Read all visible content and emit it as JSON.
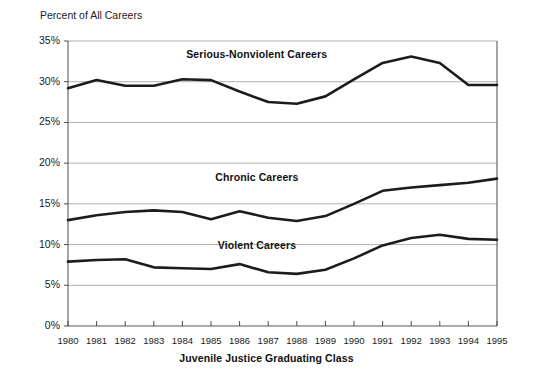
{
  "chart_data": {
    "type": "line",
    "title": "",
    "xlabel": "Juvenile Justice Graduating Class",
    "ylabel": "Percent of All Careers",
    "ylim": [
      0,
      35
    ],
    "xlim": [
      1980,
      1995
    ],
    "grid": true,
    "legend_position": "inline-annotations",
    "ytick_labels": [
      "35%",
      "30%",
      "25%",
      "20%",
      "15%",
      "10%",
      "5%",
      "0%"
    ],
    "ytick_values": [
      35,
      30,
      25,
      20,
      15,
      10,
      5,
      0
    ],
    "categories": [
      1980,
      1981,
      1982,
      1983,
      1984,
      1985,
      1986,
      1987,
      1988,
      1989,
      1990,
      1991,
      1992,
      1993,
      1994,
      1995
    ],
    "xtick_labels": [
      "1980",
      "1981",
      "1982",
      "1983",
      "1984",
      "1985",
      "1986",
      "1987",
      "1988",
      "1989",
      "1990",
      "1991",
      "1992",
      "1993",
      "1994",
      "1995"
    ],
    "series": [
      {
        "name": "Serious-Nonviolent Careers",
        "color": "#1c1c1c",
        "values": [
          29.2,
          30.2,
          29.5,
          29.5,
          30.3,
          30.2,
          28.8,
          27.5,
          27.3,
          28.2,
          30.3,
          32.3,
          33.1,
          32.3,
          29.6,
          29.6
        ]
      },
      {
        "name": "Chronic Careers",
        "color": "#1c1c1c",
        "values": [
          13.0,
          13.6,
          14.0,
          14.2,
          14.0,
          13.1,
          14.1,
          13.3,
          12.9,
          13.5,
          15.0,
          16.6,
          17.0,
          17.3,
          17.6,
          18.1
        ]
      },
      {
        "name": "Violent Careers",
        "color": "#1c1c1c",
        "values": [
          7.9,
          8.1,
          8.2,
          7.2,
          7.1,
          7.0,
          7.6,
          6.6,
          6.4,
          6.9,
          8.3,
          9.9,
          10.8,
          11.2,
          10.7,
          10.6
        ]
      }
    ],
    "annotations": [
      {
        "text": "Serious-Nonviolent Careers",
        "x": 1986.6,
        "y": 33.4
      },
      {
        "text": "Chronic Careers",
        "x": 1986.6,
        "y": 18.3
      },
      {
        "text": "Violent Careers",
        "x": 1986.6,
        "y": 9.9
      }
    ]
  }
}
